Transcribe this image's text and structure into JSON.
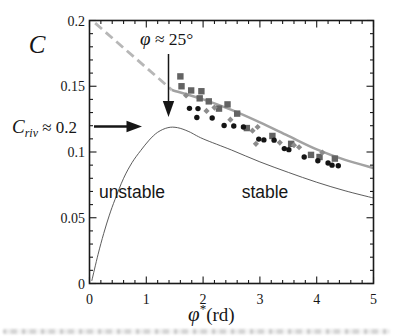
{
  "chart": {
    "colors": {
      "frame": "#1a1a1a",
      "dashed_line": "#b7b7b7",
      "fit_line": "#a2a2a2",
      "stability_curve": "#4a4a4a",
      "square_marker": "#636363",
      "circle_marker": "#141414",
      "diamond_marker": "#8c8c8c",
      "text": "#161616"
    },
    "labels": {
      "y_axis_symbol": "C",
      "x_axis_symbol": "φ",
      "x_axis_sup": "*",
      "x_axis_unit": "(rd)",
      "phi_annotation_symbol": "φ",
      "phi_annotation_rest": " ≈ 25°",
      "criv_symbol": "C",
      "criv_sub": "riv",
      "criv_rest": " ≈ 0.2",
      "unstable_region": "unstable",
      "stable_region": "stable"
    }
  },
  "chart_data": {
    "type": "scatter",
    "title": "",
    "xlabel": "φ*(rd)",
    "ylabel": "C",
    "xlim": [
      0,
      5
    ],
    "ylim": [
      0,
      0.2
    ],
    "x_ticks": [
      0,
      1,
      2,
      3,
      4,
      5
    ],
    "y_ticks": [
      0,
      0.05,
      0.1,
      0.15,
      0.2
    ],
    "y_tick_labels": [
      "0",
      "0.05",
      "0.1",
      "0.15",
      "0.2"
    ],
    "x_minor_step": 0.2,
    "y_minor_step": 0.01,
    "grid": false,
    "legend": "none",
    "annotations": [
      {
        "text": "φ ≈ 25°",
        "note": "arrow pointing down to fit line near x=1.4"
      },
      {
        "text": "Criv ≈ 0.2",
        "note": "arrow pointing right at peak of stability curve, y≈0.119"
      },
      {
        "text": "unstable",
        "note": "region left of stability curve"
      },
      {
        "text": "stable",
        "note": "region right of stability curve"
      }
    ],
    "curves": [
      {
        "name": "friction-angle-dashed",
        "style": "dashed",
        "points": [
          [
            0.1,
            0.198
          ],
          [
            1.45,
            0.1472
          ]
        ]
      },
      {
        "name": "friction-angle-fit",
        "style": "solid",
        "points": [
          [
            1.45,
            0.1472
          ],
          [
            2.0,
            0.14
          ],
          [
            2.5,
            0.132
          ],
          [
            3.0,
            0.1225
          ],
          [
            3.5,
            0.1122
          ],
          [
            4.0,
            0.102
          ],
          [
            4.5,
            0.094
          ],
          [
            5.0,
            0.0878
          ]
        ]
      },
      {
        "name": "stability-limit",
        "style": "thin",
        "points": [
          [
            0.04,
            0.002
          ],
          [
            0.15,
            0.022
          ],
          [
            0.25,
            0.038
          ],
          [
            0.35,
            0.052
          ],
          [
            0.45,
            0.064
          ],
          [
            0.6,
            0.08
          ],
          [
            0.75,
            0.092
          ],
          [
            0.9,
            0.101
          ],
          [
            1.05,
            0.109
          ],
          [
            1.2,
            0.115
          ],
          [
            1.38,
            0.1185
          ],
          [
            1.55,
            0.1185
          ],
          [
            1.75,
            0.1155
          ],
          [
            2.0,
            0.11
          ],
          [
            2.5,
            0.1015
          ],
          [
            3.0,
            0.0925
          ],
          [
            3.5,
            0.0845
          ],
          [
            4.0,
            0.077
          ],
          [
            4.5,
            0.0705
          ],
          [
            5.0,
            0.065
          ]
        ]
      }
    ],
    "series": [
      {
        "name": "squares",
        "marker": "square",
        "points": [
          [
            1.6,
            0.1575
          ],
          [
            1.62,
            0.15
          ],
          [
            1.79,
            0.1468
          ],
          [
            1.97,
            0.1462
          ],
          [
            1.94,
            0.1408
          ],
          [
            2.1,
            0.1385
          ],
          [
            2.28,
            0.133
          ],
          [
            2.43,
            0.1362
          ],
          [
            2.6,
            0.1292
          ],
          [
            2.77,
            0.1182
          ],
          [
            3.22,
            0.1122
          ],
          [
            3.55,
            0.1062
          ],
          [
            3.9,
            0.0978
          ],
          [
            4.05,
            0.0962
          ],
          [
            4.32,
            0.095
          ]
        ]
      },
      {
        "name": "circles",
        "marker": "circle",
        "points": [
          [
            1.76,
            0.1332
          ],
          [
            1.91,
            0.133
          ],
          [
            1.89,
            0.1262
          ],
          [
            2.16,
            0.1258
          ],
          [
            2.37,
            0.1202
          ],
          [
            2.54,
            0.1198
          ],
          [
            2.71,
            0.119
          ],
          [
            2.98,
            0.1098
          ],
          [
            3.07,
            0.1092
          ],
          [
            3.25,
            0.109
          ],
          [
            3.43,
            0.1026
          ],
          [
            3.51,
            0.1018
          ],
          [
            3.78,
            0.0962
          ],
          [
            4.02,
            0.0934
          ],
          [
            4.2,
            0.0916
          ],
          [
            4.27,
            0.09
          ],
          [
            4.38,
            0.0896
          ]
        ]
      },
      {
        "name": "diamonds",
        "marker": "diamond",
        "points": [
          [
            1.7,
            0.143
          ],
          [
            2.06,
            0.1312
          ],
          [
            2.2,
            0.1338
          ],
          [
            2.48,
            0.1246
          ],
          [
            2.87,
            0.1162
          ],
          [
            2.96,
            0.119
          ],
          [
            2.93,
            0.1062
          ],
          [
            3.35,
            0.1072
          ],
          [
            3.6,
            0.1052
          ],
          [
            3.69,
            0.1036
          ],
          [
            4.1,
            0.0996
          ]
        ]
      }
    ]
  }
}
